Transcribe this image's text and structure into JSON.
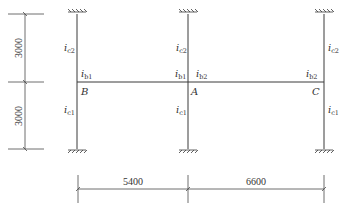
{
  "diagram": {
    "title": "",
    "type": "two-span single-storey frame with columns above and below beam",
    "nodes": [
      {
        "id": "B",
        "label": "B"
      },
      {
        "id": "A",
        "label": "A"
      },
      {
        "id": "C",
        "label": "C"
      }
    ],
    "stiffness_labels": {
      "col_upper": {
        "base": "i",
        "sub": "c2"
      },
      "col_lower": {
        "base": "i",
        "sub": "c1"
      },
      "beam_left": {
        "base": "i",
        "sub": "b1"
      },
      "beam_right": {
        "base": "i",
        "sub": "b2"
      }
    },
    "dimensions": {
      "vertical": [
        "3000",
        "3000"
      ],
      "horizontal": [
        "5400",
        "6600"
      ]
    },
    "colors": {
      "line": "#3a3a3a",
      "background": "#ffffff"
    }
  }
}
